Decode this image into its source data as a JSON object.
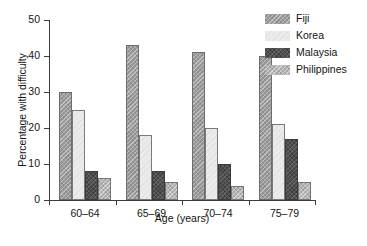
{
  "chart_data": {
    "type": "bar",
    "title": "",
    "subtitle": "",
    "xlabel": "Age (years)",
    "ylabel": "Percentage with difficulty",
    "categories": [
      "60–64",
      "65–69",
      "70–74",
      "75–79"
    ],
    "series": [
      {
        "name": "Fiji",
        "values": [
          30,
          43,
          41,
          40
        ],
        "color": "#9a9a9a",
        "pattern": "dense-stipple"
      },
      {
        "name": "Korea",
        "values": [
          25,
          18,
          20,
          21
        ],
        "color": "#ebebeb",
        "pattern": "near-white"
      },
      {
        "name": "Malaysia",
        "values": [
          8,
          8,
          10,
          17
        ],
        "color": "#4e4e4e",
        "pattern": "dark-solid"
      },
      {
        "name": "Philippines",
        "values": [
          6,
          5,
          4,
          5
        ],
        "color": "#b4b4b4",
        "pattern": "light-hatch"
      }
    ],
    "ylim": [
      0,
      50
    ],
    "yticks": [
      0,
      10,
      20,
      30,
      40,
      50
    ],
    "ytick_labels": [
      "0",
      "10",
      "20",
      "30",
      "40",
      "50"
    ],
    "grid": false,
    "legend_position": "top-right",
    "legend_entries": [
      "Fiji",
      "Korea",
      "Malaysia",
      "Philippines"
    ],
    "annotations": []
  },
  "axis": {
    "ylabel": "Percentage with difficulty",
    "xlabel": "Age (years)"
  }
}
